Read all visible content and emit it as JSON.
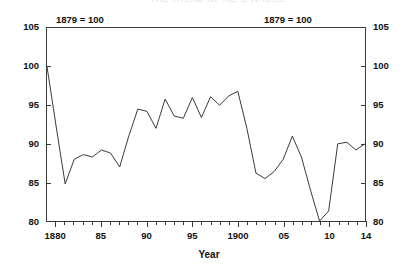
{
  "cut_off_header": "THE TREND OF REAL WAGES",
  "notes": {
    "left": "1879 = 100",
    "right": "1879 = 100"
  },
  "axis": {
    "x_title": "Year",
    "y_ticks": [
      "105",
      "100",
      "95",
      "90",
      "85",
      "80"
    ],
    "y_ticks_right": [
      "105",
      "100",
      "95",
      "90",
      "85",
      "80"
    ],
    "x_ticks": [
      "1880",
      "85",
      "90",
      "95",
      "1900",
      "05",
      "10",
      "14"
    ]
  },
  "chart_data": {
    "type": "line",
    "title": "",
    "subtitle": "",
    "xlabel": "Year",
    "ylabel": "",
    "annotations": [
      "1879 = 100",
      "1879 = 100"
    ],
    "grid": false,
    "legend": "none",
    "xlim": [
      1879,
      1914
    ],
    "ylim": [
      80,
      105
    ],
    "x_tick_interval": 1,
    "x_label_interval": 5,
    "y_tick_interval": 5,
    "x": [
      1879,
      1880,
      1881,
      1882,
      1883,
      1884,
      1885,
      1886,
      1887,
      1888,
      1889,
      1890,
      1891,
      1892,
      1893,
      1894,
      1895,
      1896,
      1897,
      1898,
      1899,
      1900,
      1901,
      1902,
      1903,
      1904,
      1905,
      1906,
      1907,
      1908,
      1909,
      1910,
      1911,
      1912,
      1913,
      1914
    ],
    "values": [
      100.0,
      92.3,
      84.8,
      88.0,
      88.6,
      88.3,
      89.2,
      88.8,
      87.0,
      91.0,
      94.5,
      94.2,
      92.0,
      95.8,
      93.6,
      93.3,
      96.0,
      93.4,
      96.1,
      95.0,
      96.2,
      96.8,
      92.0,
      86.2,
      85.5,
      86.4,
      88.0,
      91.0,
      88.3,
      84.0,
      80.0,
      81.3,
      90.0,
      90.2,
      89.2,
      90.0
    ],
    "series": [
      {
        "name": "Real wage index",
        "color": "#3a3a3a",
        "values": [
          100.0,
          92.3,
          84.8,
          88.0,
          88.6,
          88.3,
          89.2,
          88.8,
          87.0,
          91.0,
          94.5,
          94.2,
          92.0,
          95.8,
          93.6,
          93.3,
          96.0,
          93.4,
          96.1,
          95.0,
          96.2,
          96.8,
          92.0,
          86.2,
          85.5,
          86.4,
          88.0,
          91.0,
          88.3,
          84.0,
          80.0,
          81.3,
          90.0,
          90.2,
          89.2,
          90.0
        ]
      }
    ]
  }
}
